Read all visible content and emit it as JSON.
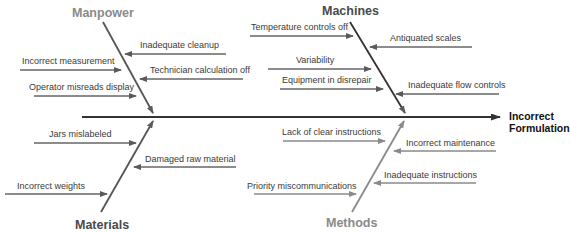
{
  "diagram": {
    "type": "fishbone",
    "effect": {
      "line1": "Incorrect",
      "line2": "Formulation"
    },
    "categories": {
      "manpower": {
        "label": "Manpower",
        "causes": [
          "Inadequate cleanup",
          "Incorrect measurement",
          "Technician calculation off",
          "Operator misreads display"
        ]
      },
      "machines": {
        "label": "Machines",
        "causes": [
          "Temperature controls off",
          "Antiquated scales",
          "Variability",
          "Equipment in disrepair",
          "Inadequate flow controls"
        ]
      },
      "materials": {
        "label": "Materials",
        "causes": [
          "Jars mislabeled",
          "Damaged raw material",
          "Incorrect weights"
        ]
      },
      "methods": {
        "label": "Methods",
        "causes": [
          "Lack of clear instructions",
          "Incorrect maintenance",
          "Inadequate instructions",
          "Priority miscommunications"
        ]
      }
    },
    "colors": {
      "spine": "#333333",
      "dark_bone": "#555555",
      "light_bone": "#8a8a8a",
      "cause_arrow": "#666666",
      "text": "#3a3a3a"
    }
  }
}
